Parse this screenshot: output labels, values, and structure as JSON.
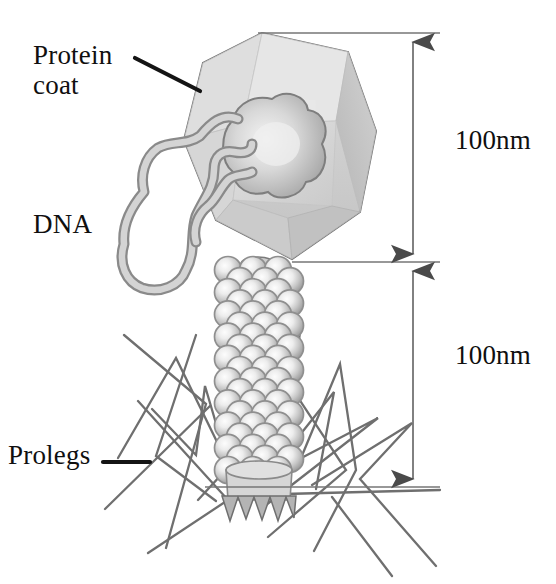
{
  "figure": {
    "background_color": "#ffffff",
    "width": 556,
    "height": 584
  },
  "labels": {
    "protein_coat": "Protein\ncoat",
    "dna": "DNA",
    "prolegs": "Prolegs"
  },
  "dimensions": {
    "head_height": "100nm",
    "tail_height": "100nm"
  },
  "colors": {
    "text": "#100f0f",
    "leader_line": "#141414",
    "dimension_line": "#6b6b6b",
    "arrowhead": "#4a4a4a",
    "capsid_outline": "#6e6e6e",
    "capsid_light": "#dcdcdc",
    "capsid_mid": "#cfcfcf",
    "capsid_shade": "#bdbdbd",
    "capsid_dark": "#ababab",
    "dna_fill": "#cdcdcd",
    "dna_outline": "#8a8a8a",
    "sphere_rim": "#8f8f8f",
    "sphere_core": "#f2f2f2",
    "proleg_line": "#6f6f6f",
    "baseplate_fill": "#d2d2d2"
  },
  "structure": {
    "capsid_shape": "icosahedral-hexagon",
    "tail_sheath_rows": 19,
    "tail_sheath_columns": 3,
    "proleg_count": 14,
    "baseplate_spikes": 5
  }
}
